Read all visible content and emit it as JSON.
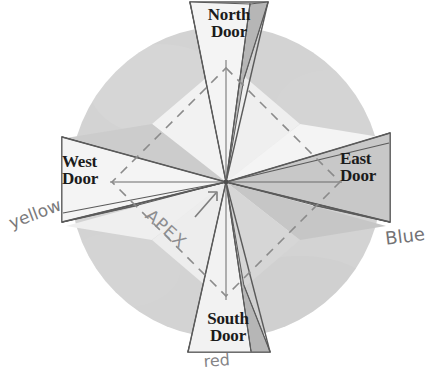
{
  "diagram": {
    "center_label": "APEX",
    "doors": {
      "north": {
        "line1": "North",
        "line2": "Door"
      },
      "south": {
        "line1": "South",
        "line2": "Door"
      },
      "west": {
        "line1": "West",
        "line2": "Door"
      },
      "east": {
        "line1": "East",
        "line2": "Door"
      }
    },
    "handwritten_notes": {
      "west_color": "yellow",
      "east_color": "Blue",
      "south_color": "red"
    },
    "colors": {
      "page_background": "#ffffff",
      "circle_fill": "#d2d2d2",
      "light_wedge": "#efefef",
      "mid_wedge": "#c9c9c9",
      "dark_wedge": "#b0b0b0",
      "door_light": "#f4f4f4",
      "door_dark": "#bcbcbc",
      "outline": "#565656",
      "dashed_line": "#8b8b8b",
      "text": "#1b1b1b",
      "handwriting": "#555457",
      "apex_text": "#8d8d90"
    },
    "geometry": {
      "center_x": 226,
      "center_y": 182,
      "circle_radius": 156,
      "door_count": 4
    }
  }
}
